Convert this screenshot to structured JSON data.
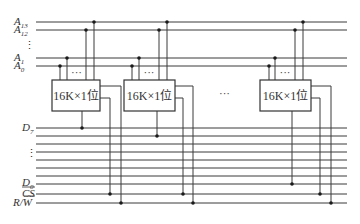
{
  "diagram": {
    "address_lines": [
      {
        "name": "A",
        "sub": "13"
      },
      {
        "name": "A",
        "sub": "12"
      },
      {
        "name": "A",
        "sub": "1"
      },
      {
        "name": "A",
        "sub": "0"
      }
    ],
    "address_ellipsis": "⋮",
    "data_lines": [
      {
        "name": "D",
        "sub": "7"
      },
      {
        "name": "D",
        "sub": "0"
      }
    ],
    "data_ellipsis": "⋮",
    "control_lines": [
      {
        "name": "CS",
        "overline": true
      },
      {
        "name": "R/W",
        "overline_part": "W"
      }
    ],
    "chips": [
      {
        "label": "16K×1位",
        "pin_ellipsis": "···",
        "data_line": "D7"
      },
      {
        "label": "16K×1位",
        "pin_ellipsis": "···",
        "data_line": "D6"
      },
      {
        "label": "16K×1位",
        "pin_ellipsis": "···",
        "data_line": "D0"
      }
    ],
    "chip_ellipsis": "···",
    "data_bus_count": 8
  }
}
